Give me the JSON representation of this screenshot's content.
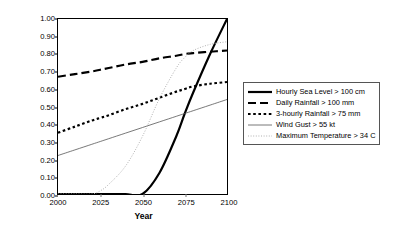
{
  "chart_data": {
    "type": "line",
    "title": "",
    "xlabel": "Year",
    "ylabel": "Probability of Occurrence in a Year",
    "xlim": [
      2000,
      2100
    ],
    "ylim": [
      0.0,
      1.0
    ],
    "xticks": [
      "2000",
      "2025",
      "2050",
      "2075",
      "2100"
    ],
    "xtick_values": [
      2000,
      2025,
      2050,
      2075,
      2100
    ],
    "yticks": [
      "0.00",
      "0.10",
      "0.20",
      "0.30",
      "0.40",
      "0.50",
      "0.60",
      "0.70",
      "0.80",
      "0.90",
      "1.00"
    ],
    "ytick_values": [
      0.0,
      0.1,
      0.2,
      0.3,
      0.4,
      0.5,
      0.6,
      0.7,
      0.8,
      0.9,
      1.0
    ],
    "grid": false,
    "legend_position": "right",
    "x": [
      2000,
      2010,
      2020,
      2025,
      2030,
      2040,
      2050,
      2060,
      2070,
      2075,
      2080,
      2090,
      2100
    ],
    "series": [
      {
        "name": "Hourly Sea Level > 100 cm",
        "style": "solid-thick",
        "color": "#000000",
        "values": [
          0.0,
          0.0,
          0.0,
          0.0,
          0.0,
          0.0,
          0.0,
          0.12,
          0.33,
          0.46,
          0.58,
          0.8,
          1.0
        ]
      },
      {
        "name": "Daily Rainfall > 100 mm",
        "style": "long-dash",
        "color": "#000000",
        "values": [
          0.67,
          0.685,
          0.7,
          0.71,
          0.72,
          0.74,
          0.755,
          0.775,
          0.79,
          0.8,
          0.805,
          0.813,
          0.82
        ]
      },
      {
        "name": "3-hourly Rainfall > 75 mm",
        "style": "short-dash",
        "color": "#000000",
        "values": [
          0.35,
          0.385,
          0.42,
          0.435,
          0.45,
          0.485,
          0.515,
          0.55,
          0.585,
          0.6,
          0.615,
          0.63,
          0.64
        ]
      },
      {
        "name": "Wind Gust > 55 kt",
        "style": "solid-thin",
        "color": "#555555",
        "values": [
          0.22,
          0.252,
          0.284,
          0.3,
          0.316,
          0.348,
          0.38,
          0.412,
          0.444,
          0.46,
          0.476,
          0.508,
          0.54
        ]
      },
      {
        "name": "Maximum Temperature > 34 C",
        "style": "dotted",
        "color": "#b0b0b0",
        "values": [
          0.0,
          0.0,
          0.0,
          0.018,
          0.055,
          0.16,
          0.33,
          0.545,
          0.72,
          0.78,
          0.82,
          0.855,
          0.87
        ]
      }
    ]
  },
  "legend": {
    "items": [
      {
        "label": "Hourly Sea Level > 100 cm",
        "style": "solid-thick"
      },
      {
        "label": "Daily Rainfall > 100 mm",
        "style": "long-dash"
      },
      {
        "label": "3-hourly Rainfall > 75 mm",
        "style": "short-dash"
      },
      {
        "label": "Wind Gust > 55 kt",
        "style": "solid-thin"
      },
      {
        "label": "Maximum Temperature > 34 C",
        "style": "dotted"
      }
    ]
  }
}
